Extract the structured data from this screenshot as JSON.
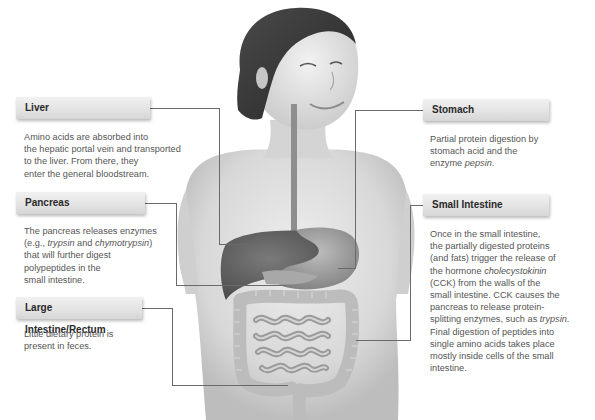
{
  "figure": {
    "colors": {
      "label_box_light": "#f1f1f1",
      "label_box_dark": "#d6d6d6",
      "label_text": "#2a2a2a",
      "body_text": "#555555",
      "leader_line": "#6a6a6a",
      "skin": "#d9d9d9",
      "hair": "#3a3a3a",
      "liver": "#5e5e5e",
      "stomach": "#8a8a8a",
      "intestine": "#b8b8b8"
    }
  },
  "callouts": {
    "liver": {
      "title": "Liver",
      "lines": [
        "Amino acids are absorbed into",
        "the hepatic portal vein and transported",
        "to the liver. From there, they",
        "enter the general bloodstream."
      ]
    },
    "pancreas": {
      "title": "Pancreas",
      "lines": [
        "The pancreas releases enzymes",
        "(e.g., ",
        "trypsin",
        " and ",
        "chymotrypsin",
        ")",
        "that will further digest",
        "polypeptides in the",
        "small intestine."
      ]
    },
    "large_intestine": {
      "title": "Large Intestine/Rectum",
      "lines": [
        "Little dietary protein is",
        "present in feces."
      ]
    },
    "stomach": {
      "title": "Stomach",
      "lines": [
        "Partial protein digestion by",
        "stomach acid and the",
        "enzyme ",
        "pepsin",
        "."
      ]
    },
    "small_intestine": {
      "title": "Small Intestine",
      "lines": [
        "Once in the small intestine,",
        "the partially digested proteins",
        "(and fats) trigger the release of",
        "the hormone ",
        "cholecystokinin",
        "(CCK) from the walls of the",
        "small intestine. CCK causes the",
        "pancreas to release protein-",
        "splitting enzymes, such as ",
        "trypsin",
        ".",
        "Final digestion of peptides into",
        "single amino acids takes place",
        "mostly inside cells of the small",
        "intestine."
      ]
    }
  }
}
